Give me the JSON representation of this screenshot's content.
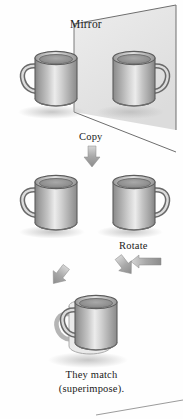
{
  "figure": {
    "background_color": "#fefefe",
    "ink_color": "#1b1b1b"
  },
  "labels": {
    "mirror": "Mirror",
    "copy": "Copy",
    "rotate": "Rotate",
    "match_line1": "They match",
    "match_line2": "(superimpose)."
  },
  "palette": {
    "mug_dark": "#8d8d8d",
    "mug_mid": "#b9b9b9",
    "mug_light": "#efefef",
    "mug_outline": "#5c5c5c",
    "mirror_fill": "#e6e6e6",
    "mirror_edge": "#6e6e6e",
    "arrow_dark": "#8f8f8f",
    "arrow_light": "#c9c9c9",
    "shadow": "#cfcfcf"
  },
  "stages": [
    {
      "id": "stage-mirror",
      "name": "object-and-reflection",
      "label": "Mirror",
      "mugs": [
        {
          "name": "original-mug",
          "handle_side": "left"
        },
        {
          "name": "reflected-mug",
          "handle_side": "right"
        }
      ]
    },
    {
      "id": "stage-copy",
      "name": "copied-pair",
      "label": "Copy",
      "arrow": {
        "name": "copy-arrow",
        "direction": "down"
      },
      "mugs": [
        {
          "name": "copy-left-mug",
          "handle_side": "left"
        },
        {
          "name": "copy-right-mug",
          "handle_side": "right"
        }
      ]
    },
    {
      "id": "stage-rotate",
      "name": "rotate-step",
      "label": "Rotate",
      "arrow": {
        "name": "rotate-arrow",
        "direction": "left"
      }
    },
    {
      "id": "stage-match",
      "name": "superimposed-result",
      "arrows": [
        {
          "name": "converge-arrow-left",
          "direction": "down-right"
        },
        {
          "name": "converge-arrow-right",
          "direction": "down-left"
        }
      ],
      "mugs": [
        {
          "name": "superimposed-mug",
          "handle_side": "left",
          "doubled": true
        }
      ],
      "caption_line1": "They match",
      "caption_line2": "(superimpose)."
    }
  ]
}
